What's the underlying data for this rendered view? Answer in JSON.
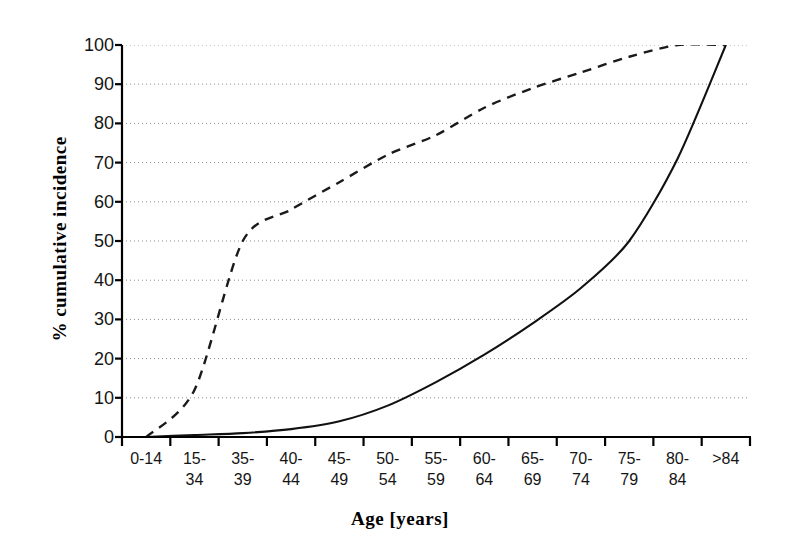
{
  "chart_data": {
    "type": "line",
    "title": "",
    "xlabel": "Age [years]",
    "ylabel": "% cumulative incidence",
    "categories": [
      "0-14",
      "15-34",
      "35-39",
      "40-44",
      "45-49",
      "50-54",
      "55-59",
      "60-64",
      "65-69",
      "70-74",
      "75-79",
      "80-84",
      ">84"
    ],
    "ylim": [
      0,
      100
    ],
    "yticks": [
      0,
      10,
      20,
      30,
      40,
      50,
      60,
      70,
      80,
      90,
      100
    ],
    "ytick_labels": [
      "0",
      "10",
      "20",
      "30",
      "40",
      "50",
      "60",
      "70",
      "80",
      "90",
      "100"
    ],
    "grid": "horizontal-dotted",
    "legend": "none",
    "series": [
      {
        "name": "dashed-series",
        "style": "dashed",
        "color": "#1a1a1a",
        "values": [
          0,
          12,
          50,
          58,
          65,
          72,
          77,
          84,
          89,
          93,
          97,
          100,
          100
        ]
      },
      {
        "name": "solid-series",
        "style": "solid",
        "color": "#111111",
        "values": [
          0,
          0.5,
          1,
          2,
          4,
          8,
          14,
          21,
          29,
          38,
          50,
          71,
          100
        ]
      }
    ]
  },
  "axes": {
    "x_title": "Age [years]",
    "y_title": "% cumulative incidence"
  }
}
